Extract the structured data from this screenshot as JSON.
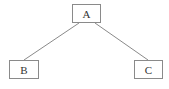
{
  "diagram": {
    "type": "tree",
    "nodes": [
      {
        "id": "A",
        "label": "A"
      },
      {
        "id": "B",
        "label": "B"
      },
      {
        "id": "C",
        "label": "C"
      }
    ],
    "edges": [
      {
        "from": "A",
        "to": "B"
      },
      {
        "from": "A",
        "to": "C"
      }
    ],
    "colors": {
      "line": "#8a8a8a",
      "text": "#333333",
      "background": "#ffffff"
    }
  }
}
